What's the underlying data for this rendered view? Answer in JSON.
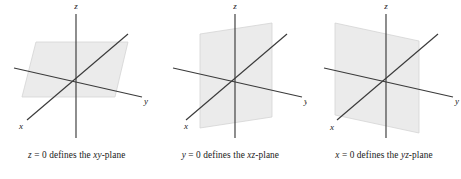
{
  "figure": {
    "background_color": "#ffffff",
    "axis_color": "#3a3a3a",
    "plane_fill": "#ebebeb",
    "plane_stroke": "#d4d4d4",
    "label_color": "#1a1a1a"
  },
  "panels": [
    {
      "id": "xy-plane-panel",
      "caption": "z = 0 defines the xy-plane",
      "caption_parts": {
        "variable": "z",
        "equals_value": "= 0",
        "phrase": "defines the",
        "plane_name": "xy",
        "plane_suffix": "-plane"
      },
      "axes": [
        {
          "name": "z",
          "label": "z",
          "label_x": 76,
          "label_y": 9
        },
        {
          "name": "x",
          "label": "x",
          "label_x": 21,
          "label_y": 126
        },
        {
          "name": "y",
          "label": "y",
          "label_x": 146,
          "label_y": 101
        }
      ],
      "plane": {
        "name": "xy-plane",
        "orientation": "horizontal",
        "contains_axes": [
          "x",
          "y"
        ],
        "zero_axis": "z"
      }
    },
    {
      "id": "xz-plane-panel",
      "caption": "y = 0 defines the xz-plane",
      "caption_parts": {
        "variable": "y",
        "equals_value": "= 0",
        "phrase": "defines the",
        "plane_name": "xz",
        "plane_suffix": "-plane"
      },
      "axes": [
        {
          "name": "z",
          "label": "z",
          "label_x": 81,
          "label_y": 9
        },
        {
          "name": "x",
          "label": "x",
          "label_x": 32,
          "label_y": 126
        },
        {
          "name": "y",
          "label": "y",
          "label_x": 152,
          "label_y": 101
        }
      ],
      "plane": {
        "name": "xz-plane",
        "orientation": "vertical",
        "contains_axes": [
          "x",
          "z"
        ],
        "zero_axis": "y"
      }
    },
    {
      "id": "yz-plane-panel",
      "caption": "x = 0 defines the yz-plane",
      "caption_parts": {
        "variable": "x",
        "equals_value": "= 0",
        "phrase": "defines the",
        "plane_name": "yz",
        "plane_suffix": "-plane"
      },
      "axes": [
        {
          "name": "z",
          "label": "z",
          "label_x": 79,
          "label_y": 9
        },
        {
          "name": "x",
          "label": "x",
          "label_x": 25,
          "label_y": 127
        },
        {
          "name": "y",
          "label": "y",
          "label_x": 150,
          "label_y": 101
        }
      ],
      "plane": {
        "name": "yz-plane",
        "orientation": "vertical",
        "contains_axes": [
          "y",
          "z"
        ],
        "zero_axis": "x"
      }
    }
  ]
}
